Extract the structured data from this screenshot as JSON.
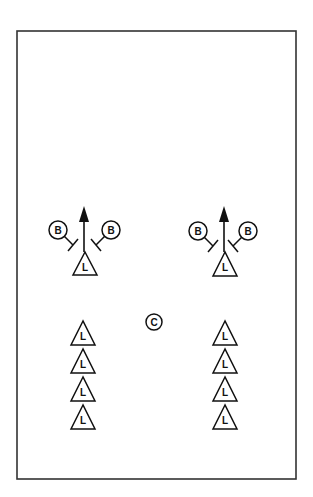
{
  "diagram": {
    "type": "drill",
    "field": {
      "x": 17,
      "y": 31,
      "width": 279,
      "height": 448,
      "stroke": "#333333"
    },
    "colors": {
      "ink": "#111111",
      "background": "#ffffff"
    },
    "groups": [
      {
        "id": "left",
        "arrow": {
          "x": 84,
          "y1": 252,
          "y2": 206
        },
        "leader": {
          "label": "L",
          "cx": 85,
          "top": 252,
          "bottom": 275,
          "half_width": 12
        },
        "blockers": [
          {
            "label": "B",
            "cx": 58,
            "cy": 230,
            "side": "left"
          },
          {
            "label": "B",
            "cx": 111,
            "cy": 230,
            "side": "right"
          }
        ]
      },
      {
        "id": "right",
        "arrow": {
          "x": 224,
          "y1": 252,
          "y2": 206
        },
        "leader": {
          "label": "L",
          "cx": 225,
          "top": 252,
          "bottom": 276,
          "half_width": 12
        },
        "blockers": [
          {
            "label": "B",
            "cx": 198,
            "cy": 231,
            "side": "left"
          },
          {
            "label": "B",
            "cx": 248,
            "cy": 231,
            "side": "right"
          }
        ]
      }
    ],
    "coach": {
      "label": "C",
      "cx": 154,
      "cy": 322,
      "r": 8
    },
    "lines": [
      {
        "id": "left-line",
        "cx": 83,
        "tops": [
          321,
          349,
          377,
          405
        ],
        "label": "L"
      },
      {
        "id": "right-line",
        "cx": 225,
        "tops": [
          321,
          349,
          377,
          405
        ],
        "label": "L"
      }
    ],
    "triangle_size": {
      "half_width": 12,
      "height": 24
    }
  }
}
